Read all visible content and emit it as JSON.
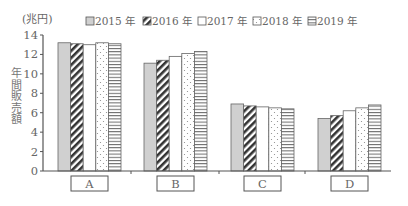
{
  "chart_data": {
    "type": "bar",
    "title": "",
    "unit_label": "(兆円)",
    "xlabel": "",
    "ylabel": "年間販売額",
    "ylim": [
      0,
      14
    ],
    "yticks": [
      0,
      2,
      4,
      6,
      8,
      10,
      12,
      14
    ],
    "grid": false,
    "legend_position": "top",
    "categories": [
      "A",
      "B",
      "C",
      "D"
    ],
    "series": [
      {
        "name": "2015 年",
        "pattern": "solid-gray",
        "values": [
          13.2,
          11.1,
          6.9,
          5.4
        ]
      },
      {
        "name": "2016 年",
        "pattern": "diagonal-stripes",
        "values": [
          13.1,
          11.4,
          6.7,
          5.7
        ]
      },
      {
        "name": "2017 年",
        "pattern": "blank",
        "values": [
          13.0,
          11.8,
          6.6,
          6.2
        ]
      },
      {
        "name": "2018 年",
        "pattern": "dots",
        "values": [
          13.2,
          12.1,
          6.5,
          6.5
        ]
      },
      {
        "name": "2019 年",
        "pattern": "horizontal-lines",
        "values": [
          13.1,
          12.3,
          6.4,
          6.8
        ]
      }
    ]
  },
  "legend": [
    {
      "label": "2015 年"
    },
    {
      "label": "2016 年"
    },
    {
      "label": "2017 年"
    },
    {
      "label": "2018 年"
    },
    {
      "label": "2019 年"
    }
  ],
  "axis": {
    "unit": "(兆円)",
    "ylabel": "年間販売額"
  }
}
